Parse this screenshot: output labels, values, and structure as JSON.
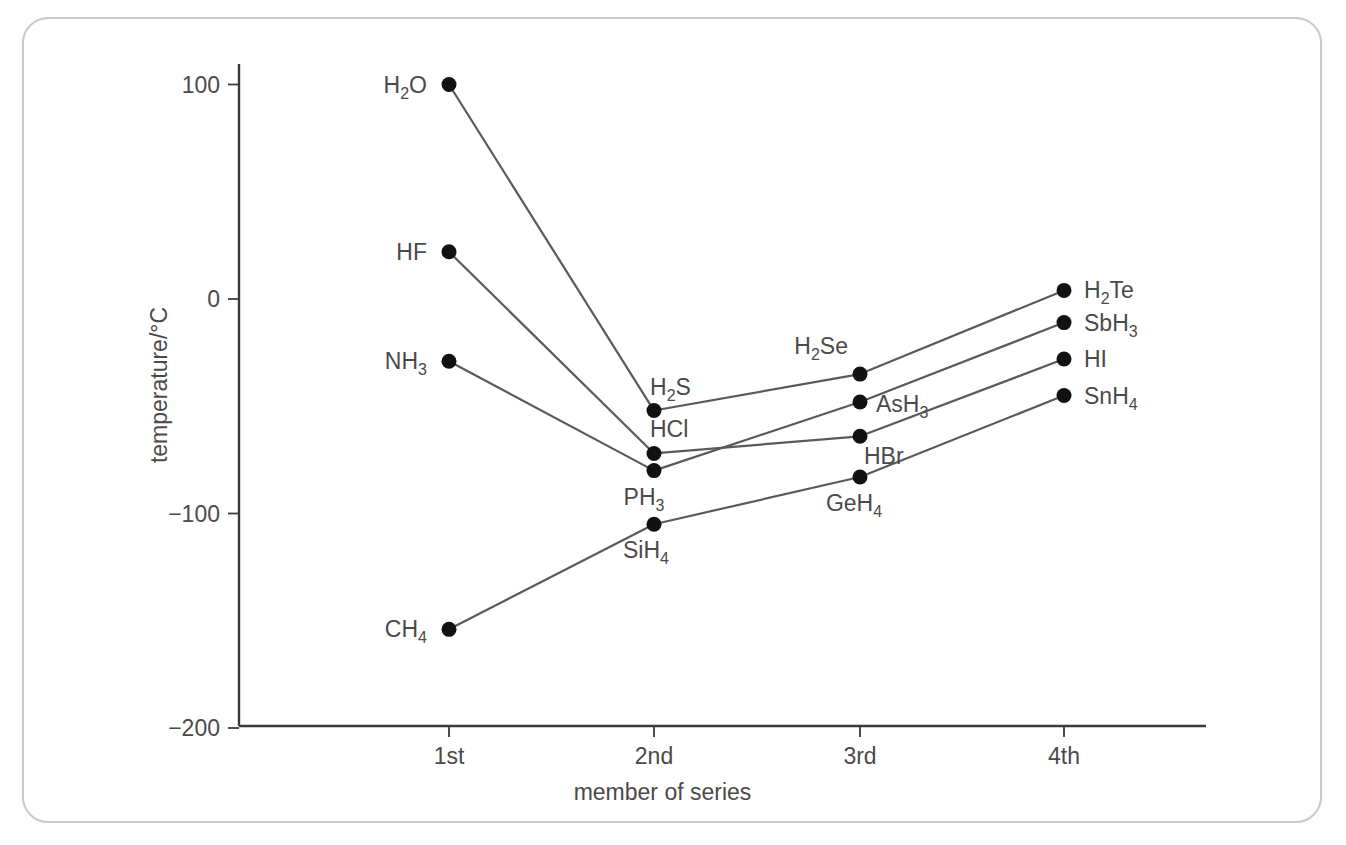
{
  "figure": {
    "frame_color": "#c9c9c9",
    "background": "#ffffff",
    "axis_color": "#3a3a3a",
    "line_color": "#5a5a5a",
    "marker_color": "#111111",
    "text_color": "#4a4a4a"
  },
  "chart_data": {
    "type": "line",
    "title": "",
    "xlabel": "member of series",
    "ylabel": "temperature/°C",
    "categories": [
      "1st",
      "2nd",
      "3rd",
      "4th"
    ],
    "x_tick_labels": [
      "1st",
      "2nd",
      "3rd",
      "4th"
    ],
    "y_tick_labels": [
      "100",
      "0",
      "−100",
      "−200"
    ],
    "y_tick_values": [
      100,
      0,
      -100,
      -200
    ],
    "ylim": [
      -200,
      130
    ],
    "grid": false,
    "legend": "none",
    "series": [
      {
        "name": "Group 16 hydrides",
        "values": [
          100,
          -52,
          -35,
          4
        ],
        "point_labels": [
          "H2O",
          "H2S",
          "H2Se",
          "H2Te"
        ],
        "point_labels_html": [
          {
            "base": "H",
            "sub": "2",
            "tail": "O"
          },
          {
            "base": "H",
            "sub": "2",
            "tail": "S"
          },
          {
            "base": "H",
            "sub": "2",
            "tail": "Se"
          },
          {
            "base": "H",
            "sub": "2",
            "tail": "Te"
          }
        ]
      },
      {
        "name": "Group 17 hydrides",
        "values": [
          22,
          -72,
          -64,
          -28
        ],
        "point_labels": [
          "HF",
          "HCl",
          "HBr",
          "HI"
        ],
        "point_labels_html": [
          {
            "base": "HF",
            "sub": "",
            "tail": ""
          },
          {
            "base": "HCl",
            "sub": "",
            "tail": ""
          },
          {
            "base": "HBr",
            "sub": "",
            "tail": ""
          },
          {
            "base": "HI",
            "sub": "",
            "tail": ""
          }
        ]
      },
      {
        "name": "Group 15 hydrides",
        "values": [
          -29,
          -80,
          -48,
          -11
        ],
        "point_labels": [
          "NH3",
          "PH3",
          "AsH3",
          "SbH3"
        ],
        "point_labels_html": [
          {
            "base": "NH",
            "sub": "3",
            "tail": ""
          },
          {
            "base": "PH",
            "sub": "3",
            "tail": ""
          },
          {
            "base": "AsH",
            "sub": "3",
            "tail": ""
          },
          {
            "base": "SbH",
            "sub": "3",
            "tail": ""
          }
        ]
      },
      {
        "name": "Group 14 hydrides",
        "values": [
          -154,
          -105,
          -83,
          -45
        ],
        "point_labels": [
          "CH4",
          "SiH4",
          "GeH4",
          "SnH4"
        ],
        "point_labels_html": [
          {
            "base": "CH",
            "sub": "4",
            "tail": ""
          },
          {
            "base": "SiH",
            "sub": "4",
            "tail": ""
          },
          {
            "base": "GeH",
            "sub": "4",
            "tail": ""
          },
          {
            "base": "SnH",
            "sub": "4",
            "tail": ""
          }
        ]
      }
    ]
  }
}
